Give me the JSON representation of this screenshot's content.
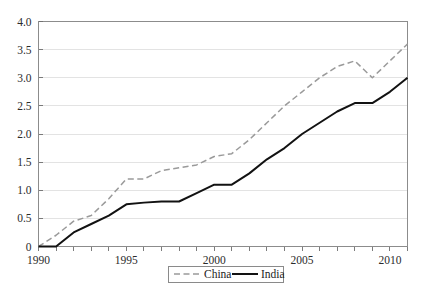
{
  "chart_data": {
    "type": "line",
    "title": "",
    "subtitle": "",
    "xlabel": "",
    "ylabel": "",
    "x": [
      1990,
      1991,
      1992,
      1993,
      1994,
      1995,
      1996,
      1997,
      1998,
      1999,
      2000,
      2001,
      2002,
      2003,
      2004,
      2005,
      2006,
      2007,
      2008,
      2009,
      2010,
      2011
    ],
    "xlim": [
      1990,
      2011
    ],
    "ylim": [
      0,
      4.0
    ],
    "y_ticks": [
      0,
      0.5,
      1.0,
      1.5,
      2.0,
      2.5,
      3.0,
      3.5,
      4.0
    ],
    "y_tick_labels": [
      "0",
      "0.5",
      "1.0",
      "1.5",
      "2.0",
      "2.5",
      "3.0",
      "3.5",
      "4.0"
    ],
    "x_ticks": [
      1990,
      1991,
      1992,
      1993,
      1994,
      1995,
      1996,
      1997,
      1998,
      1999,
      2000,
      2001,
      2002,
      2003,
      2004,
      2005,
      2006,
      2007,
      2008,
      2009,
      2010,
      2011
    ],
    "x_tick_labels": [
      "1990",
      "",
      "",
      "",
      "",
      "1995",
      "",
      "",
      "",
      "",
      "2000",
      "",
      "",
      "",
      "",
      "2005",
      "",
      "",
      "",
      "",
      "2010",
      ""
    ],
    "grid": "horizontal",
    "legend_position": "bottom-center",
    "series": [
      {
        "name": "China",
        "style": "dashed",
        "color": "#9a9a9a",
        "values": [
          0,
          0.2,
          0.45,
          0.55,
          0.85,
          1.2,
          1.2,
          1.35,
          1.4,
          1.45,
          1.6,
          1.65,
          1.9,
          2.2,
          2.5,
          2.75,
          3.0,
          3.2,
          3.3,
          3.0,
          3.3,
          3.6
        ]
      },
      {
        "name": "India",
        "style": "solid",
        "color": "#121212",
        "values": [
          0,
          0,
          0.25,
          0.4,
          0.55,
          0.75,
          0.78,
          0.8,
          0.8,
          0.95,
          1.1,
          1.1,
          1.3,
          1.55,
          1.75,
          2.0,
          2.2,
          2.4,
          2.55,
          2.55,
          2.75,
          3.0
        ]
      }
    ]
  },
  "legend": {
    "entries": [
      {
        "label": "China",
        "marker": "dashed-line-swatch"
      },
      {
        "label": "India",
        "marker": "solid-line-swatch"
      }
    ]
  },
  "colors": {
    "china_line": "#9a9a9a",
    "india_line": "#121212",
    "grid": "#dcdcdc",
    "frame": "#8c8c8c",
    "background": "#ffffff",
    "text": "#1c1c1c"
  }
}
